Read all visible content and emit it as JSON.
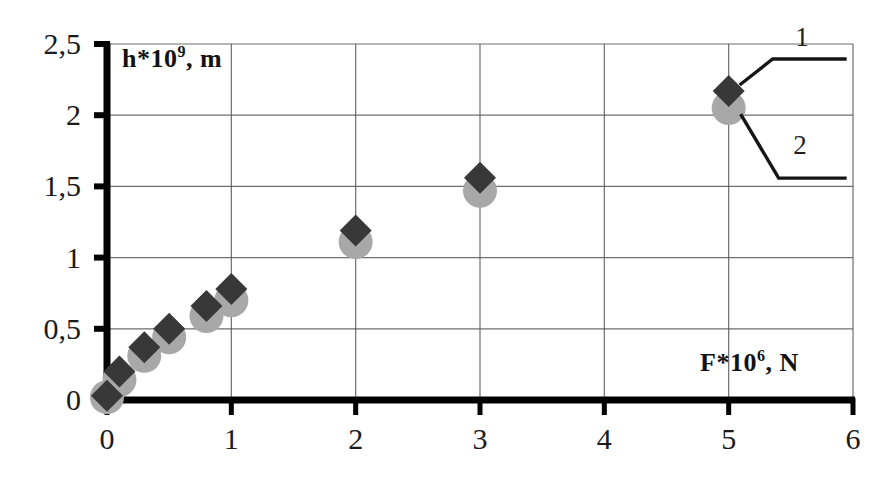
{
  "chart_data": {
    "type": "scatter",
    "title": "",
    "subtitle": "",
    "xlabel": "F*10^6, N",
    "ylabel": "h*10^9, m",
    "xlabel_parts": {
      "base": "F*10",
      "exponent": "6",
      "unit": ", N"
    },
    "ylabel_parts": {
      "base": "h*10",
      "exponent": "9",
      "unit": ", m"
    },
    "xlim": [
      0,
      6
    ],
    "ylim": [
      0,
      2.5
    ],
    "xticks": [
      0,
      1,
      2,
      3,
      4,
      5,
      6
    ],
    "yticks": [
      0,
      0.5,
      1,
      1.5,
      2,
      2.5
    ],
    "xtick_labels": [
      "0",
      "1",
      "2",
      "3",
      "4",
      "5",
      "6"
    ],
    "ytick_labels": [
      "0",
      "0,5",
      "1",
      "1,5",
      "2",
      "2,5"
    ],
    "decimal_separator": ",",
    "grid": true,
    "grid_color": "#555555",
    "axis_color": "#000000",
    "legend_position": "inside-top-right-callouts",
    "x": [
      0,
      0.1,
      0.3,
      0.5,
      0.8,
      1,
      2,
      3,
      5
    ],
    "series": [
      {
        "name": "1",
        "marker": "diamond",
        "color": "#383838",
        "values": [
          0.03,
          0.2,
          0.37,
          0.5,
          0.66,
          0.78,
          1.19,
          1.56,
          2.17
        ]
      },
      {
        "name": "2",
        "marker": "circle",
        "color": "#a8a8a8",
        "values": [
          0.02,
          0.14,
          0.31,
          0.44,
          0.59,
          0.7,
          1.11,
          1.47,
          2.05
        ]
      }
    ],
    "annotations": [
      {
        "label": "1",
        "points_to_series": "1",
        "points_to_x": 5
      },
      {
        "label": "2",
        "points_to_series": "2",
        "points_to_x": 5
      }
    ]
  },
  "callouts": {
    "one": "1",
    "two": "2"
  }
}
